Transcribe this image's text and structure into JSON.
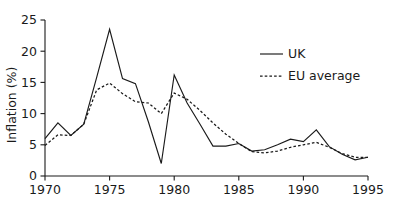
{
  "chart_data": {
    "type": "line",
    "title": "",
    "xlabel": "",
    "ylabel": "Inflation (%)",
    "xlim": [
      1970,
      1995
    ],
    "ylim": [
      0,
      25
    ],
    "xticks": [
      1970,
      1975,
      1980,
      1985,
      1990,
      1995
    ],
    "yticks": [
      0,
      5,
      10,
      15,
      20,
      25
    ],
    "xtick_labels": [
      "1970",
      "1975",
      "1980",
      "1985",
      "1990",
      "1995"
    ],
    "ytick_labels": [
      "0",
      "5",
      "10",
      "15",
      "20",
      "25"
    ],
    "grid": false,
    "legend_position": "upper right",
    "x": [
      1970,
      1971,
      1972,
      1973,
      1974,
      1975,
      1976,
      1977,
      1978,
      1979,
      1980,
      1981,
      1982,
      1983,
      1984,
      1985,
      1986,
      1987,
      1988,
      1989,
      1990,
      1991,
      1992,
      1993,
      1994,
      1995
    ],
    "series": [
      {
        "name": "UK",
        "style": "solid",
        "color": "#1a1a1a",
        "values": [
          6.0,
          8.5,
          6.5,
          8.3,
          15.8,
          23.5,
          15.6,
          14.8,
          8.7,
          2.0,
          16.2,
          11.7,
          8.3,
          4.8,
          4.8,
          5.2,
          4.0,
          4.2,
          5.0,
          5.9,
          5.5,
          7.4,
          4.7,
          3.5,
          2.6,
          3.0
        ]
      },
      {
        "name": "EU average",
        "style": "dashed",
        "color": "#1a1a1a",
        "values": [
          4.9,
          6.6,
          6.5,
          8.3,
          13.8,
          14.9,
          13.2,
          11.9,
          11.7,
          10.0,
          13.3,
          12.3,
          10.5,
          8.5,
          6.7,
          5.2,
          3.9,
          3.7,
          4.0,
          4.6,
          5.0,
          5.4,
          4.6,
          3.6,
          3.0,
          3.0
        ]
      }
    ]
  },
  "legend": {
    "items": [
      {
        "label": "UK",
        "style": "solid"
      },
      {
        "label": "EU average",
        "style": "dashed"
      }
    ]
  },
  "axes": {
    "y_title": "Inflation (%)"
  }
}
